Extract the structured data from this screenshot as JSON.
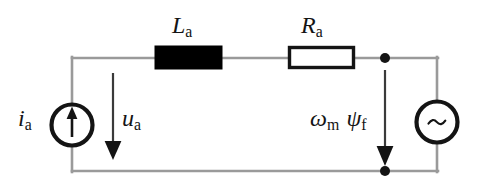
{
  "figure": {
    "kind": "electrical-circuit-schematic",
    "background_color": "#ffffff",
    "wire_color": "#9a9a9a",
    "ink_color": "#141414"
  },
  "labels": {
    "inductance": {
      "symbol": "L",
      "subscript": "a",
      "text": "La"
    },
    "resistance": {
      "symbol": "R",
      "subscript": "a",
      "text": "Ra"
    },
    "current": {
      "symbol": "i",
      "subscript": "a",
      "text": "ia"
    },
    "voltage": {
      "symbol": "u",
      "subscript": "a",
      "text": "ua"
    },
    "emf_omega": {
      "symbol": "ω",
      "subscript": "m",
      "text": "ωm"
    },
    "emf_psi": {
      "symbol": "ψ",
      "subscript": "f",
      "text": "ψf"
    }
  },
  "components": {
    "current_source": {
      "name": "current-source",
      "shape": "circle",
      "glyph": "arrow-up",
      "center": {
        "x": 72,
        "y": 125
      },
      "radius": 21
    },
    "ac_source": {
      "name": "ac-voltage-source",
      "shape": "circle",
      "glyph": "~",
      "center": {
        "x": 437,
        "y": 122
      },
      "radius": 22
    },
    "inductor": {
      "name": "inductor",
      "shape": "filled-rectangle",
      "fill": "#000000",
      "x": 155,
      "y": 46,
      "width": 67,
      "height": 23
    },
    "resistor": {
      "name": "resistor",
      "shape": "outlined-rectangle",
      "fill": "#ffffff",
      "stroke": "#141414",
      "x": 288,
      "y": 46,
      "width": 67,
      "height": 23
    },
    "nodes": [
      {
        "name": "node-top-right",
        "x": 385,
        "y": 58,
        "radius": 5
      },
      {
        "name": "node-bottom-right",
        "x": 385,
        "y": 171,
        "radius": 5
      }
    ],
    "arrows": [
      {
        "name": "voltage-arrow-ua",
        "x": 113,
        "y_start": 73,
        "y_end": 158,
        "direction": "down"
      },
      {
        "name": "emf-arrow",
        "x": 385,
        "y_start": 73,
        "y_end": 170,
        "direction": "down"
      }
    ]
  },
  "wires": {
    "top_rail": {
      "from": {
        "x": 72,
        "y": 58
      },
      "to": {
        "x": 437,
        "y": 58
      }
    },
    "bottom_rail": {
      "from": {
        "x": 72,
        "y": 171
      },
      "to": {
        "x": 437,
        "y": 171
      }
    },
    "left_rail": {
      "from": {
        "x": 72,
        "y": 58
      },
      "to": {
        "x": 72,
        "y": 171
      }
    },
    "right_rail": {
      "from": {
        "x": 437,
        "y": 58
      },
      "to": {
        "x": 437,
        "y": 171
      }
    }
  }
}
